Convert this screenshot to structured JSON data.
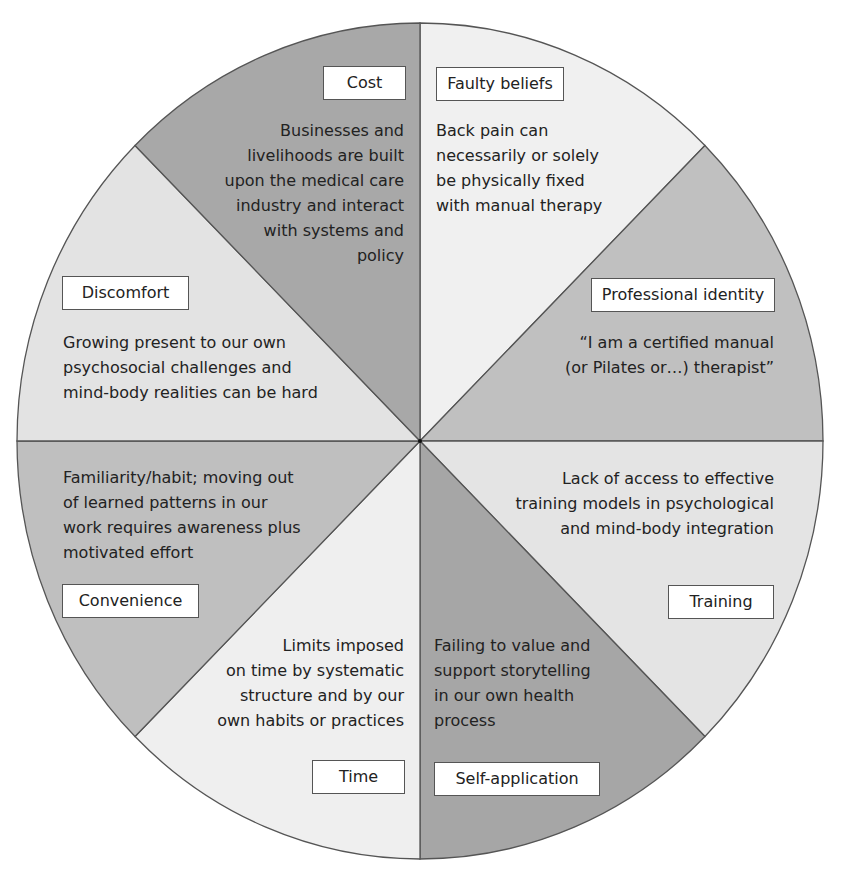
{
  "diagram": {
    "type": "pie-wheel",
    "center": [
      420,
      441
    ],
    "radius_x": 403,
    "radius_y": 418,
    "colors": {
      "dark": "#a9a9a9",
      "medium": "#c2c2c2",
      "light": "#e6e6e6",
      "lightest": "#f1f1f1",
      "stroke": "#555555",
      "label_bg": "#ffffff"
    },
    "segments": [
      {
        "id": "cost",
        "label": "Cost",
        "shade": "#a8a8a8",
        "description": "Businesses and\nlivelihoods are built\nupon the medical care\nindustry and interact\nwith systems and\npolicy"
      },
      {
        "id": "faulty-beliefs",
        "label": "Faulty beliefs",
        "shade": "#f0f0f0",
        "description": "Back pain can\nnecessarily or solely\nbe physically fixed\nwith manual therapy"
      },
      {
        "id": "professional-identity",
        "label": "Professional identity",
        "shade": "#c0c0c0",
        "description": "“I am a certified manual\n(or Pilates or…) therapist”"
      },
      {
        "id": "training",
        "label": "Training",
        "shade": "#e4e4e4",
        "description": "Lack of access to effective\ntraining models in psychological\nand mind-body integration"
      },
      {
        "id": "self-application",
        "label": "Self-application",
        "shade": "#a6a6a6",
        "description": "Failing to value and\nsupport storytelling\nin our own health\nprocess"
      },
      {
        "id": "time",
        "label": "Time",
        "shade": "#efefef",
        "description": "Limits imposed\non time by systematic\nstructure and by our\nown habits or practices"
      },
      {
        "id": "convenience",
        "label": "Convenience",
        "shade": "#bfbfbf",
        "description": "Familiarity/habit; moving out\nof learned patterns in our\nwork requires awareness plus\nmotivated effort"
      },
      {
        "id": "discomfort",
        "label": "Discomfort",
        "shade": "#e3e3e3",
        "description": "Growing present to our own\npsychosocial challenges and\nmind-body realities can be hard"
      }
    ]
  }
}
